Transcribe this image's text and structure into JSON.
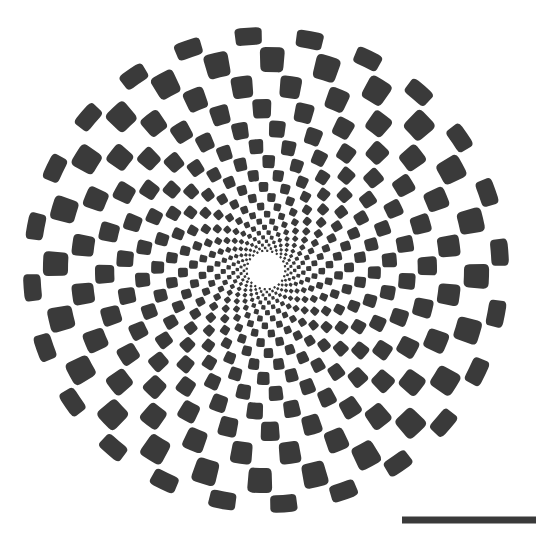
{
  "figure": {
    "background_color": "#ffffff",
    "canvas": {
      "width": 536,
      "height": 546
    }
  },
  "chart_data": {
    "type": "scatter",
    "subtitle": "",
    "xlabel": "",
    "ylabel": "",
    "grid": false,
    "legend": null,
    "annotations": [],
    "pattern": {
      "kind": "radial-checkerboard",
      "center_x": 266,
      "center_y": 270,
      "outer_radius": 244,
      "inner_hole_radius": 18,
      "sector_count": 48,
      "ring_count": 20,
      "ring_growth_ratio": 1.142,
      "twist_degrees_per_ring": 1.55,
      "fill_color": "#3a3a3a",
      "gap_color": "#ffffff",
      "angular_gap_fraction": 0.13,
      "radial_gap_fraction": 0.1,
      "corner_radius_fraction": 0.22,
      "ring_radii": [
        18,
        20.6,
        23.5,
        26.8,
        30.6,
        35,
        39.9,
        45.6,
        52.1,
        59.5,
        67.9,
        77.6,
        88.6,
        101.2,
        115.6,
        132,
        150.7,
        172.1,
        196.6,
        224.5,
        244
      ],
      "checker_parity_note": "Dark cells occupy alternating (ring + sector) parity so adjacent cells are offset like a checkerboard"
    },
    "scale_bar": {
      "x_start": 402,
      "x_end": 536,
      "y": 520,
      "thickness": 7,
      "color": "#3a3a3a",
      "label": ""
    }
  }
}
